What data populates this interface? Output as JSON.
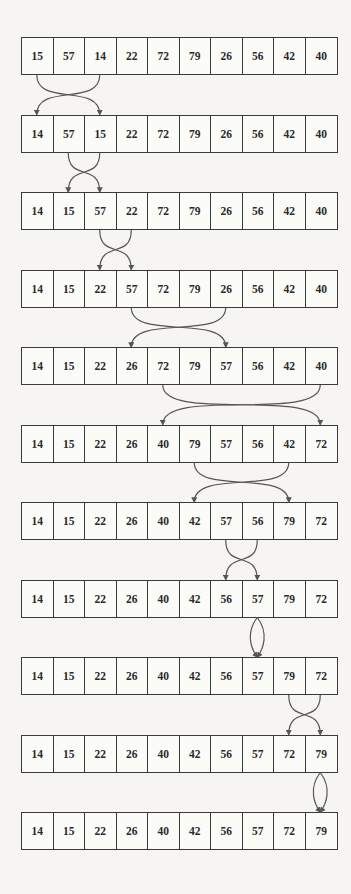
{
  "diagram": {
    "type": "selection-sort-trace",
    "colors": {
      "background": "#f6f5f1",
      "line": "#3a3a3a",
      "arrow": "#555555"
    },
    "rows": [
      {
        "values": [
          "15",
          "57",
          "14",
          "22",
          "72",
          "79",
          "26",
          "56",
          "42",
          "40"
        ],
        "swap_after": [
          0,
          2
        ]
      },
      {
        "values": [
          "14",
          "57",
          "15",
          "22",
          "72",
          "79",
          "26",
          "56",
          "42",
          "40"
        ],
        "swap_after": [
          1,
          2
        ]
      },
      {
        "values": [
          "14",
          "15",
          "57",
          "22",
          "72",
          "79",
          "26",
          "56",
          "42",
          "40"
        ],
        "swap_after": [
          2,
          3
        ]
      },
      {
        "values": [
          "14",
          "15",
          "22",
          "57",
          "72",
          "79",
          "26",
          "56",
          "42",
          "40"
        ],
        "swap_after": [
          3,
          6
        ]
      },
      {
        "values": [
          "14",
          "15",
          "22",
          "26",
          "72",
          "79",
          "57",
          "56",
          "42",
          "40"
        ],
        "swap_after": [
          4,
          9
        ]
      },
      {
        "values": [
          "14",
          "15",
          "22",
          "26",
          "40",
          "79",
          "57",
          "56",
          "42",
          "72"
        ],
        "swap_after": [
          5,
          8
        ]
      },
      {
        "values": [
          "14",
          "15",
          "22",
          "26",
          "40",
          "42",
          "57",
          "56",
          "79",
          "72"
        ],
        "swap_after": [
          6,
          7
        ]
      },
      {
        "values": [
          "14",
          "15",
          "22",
          "26",
          "40",
          "42",
          "56",
          "57",
          "79",
          "72"
        ],
        "swap_after": [
          7,
          7
        ]
      },
      {
        "values": [
          "14",
          "15",
          "22",
          "26",
          "40",
          "42",
          "56",
          "57",
          "79",
          "72"
        ],
        "swap_after": [
          8,
          9
        ]
      },
      {
        "values": [
          "14",
          "15",
          "22",
          "26",
          "40",
          "42",
          "56",
          "57",
          "72",
          "79"
        ],
        "swap_after": [
          9,
          9
        ]
      },
      {
        "values": [
          "14",
          "15",
          "22",
          "26",
          "40",
          "42",
          "56",
          "57",
          "72",
          "79"
        ],
        "swap_after": null
      }
    ]
  }
}
